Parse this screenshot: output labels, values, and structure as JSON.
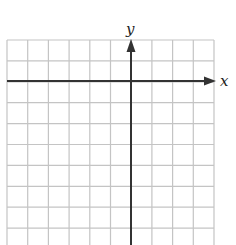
{
  "diagram": {
    "type": "coordinate-grid",
    "grid": {
      "columns": 10,
      "rows": 10,
      "left": 7,
      "top": 40,
      "cell_width": 20.7,
      "cell_height": 20.9,
      "line_color": "#c4c4c4"
    },
    "axes": {
      "x_axis": {
        "label": "x",
        "y_pos": 81,
        "x_start": 7,
        "x_end": 214,
        "arrow": "right"
      },
      "y_axis": {
        "label": "y",
        "x_pos": 131,
        "y_start": 245,
        "y_end": 40,
        "arrow": "up"
      },
      "color": "#333333"
    }
  }
}
